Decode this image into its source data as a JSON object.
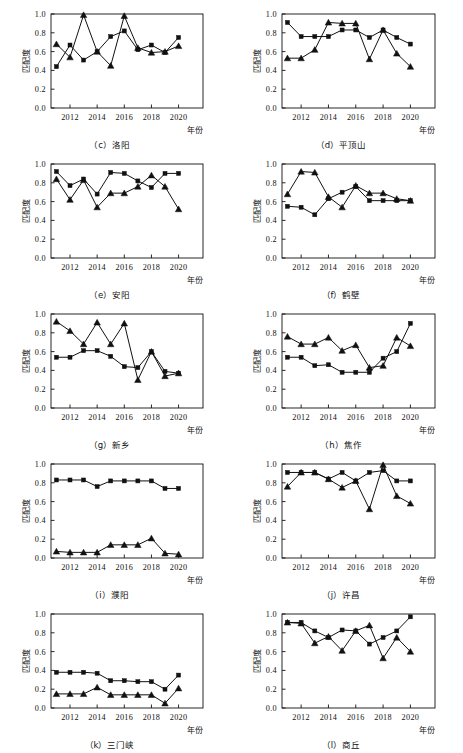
{
  "figure": {
    "axis_label_y": "匹配度",
    "axis_label_x": "年份",
    "y_ticks": [
      "0.0",
      "0.2",
      "0.4",
      "0.6",
      "0.8",
      "1.0"
    ],
    "x_ticks": [
      "2012",
      "2014",
      "2016",
      "2018",
      "2020"
    ],
    "marker_square": "square-marker",
    "marker_triangle": "triangle-marker",
    "line_color": "#111111"
  },
  "chart_data": [
    {
      "type": "line",
      "panel_id": "c",
      "title": "（c）洛阳",
      "caption_label": "（c）洛阳",
      "xlabel": "年份",
      "ylabel": "匹配度",
      "ylim": [
        0.0,
        1.0
      ],
      "xlim": [
        2010.6,
        2021.8
      ],
      "grid": false,
      "legend": "none",
      "x": [
        2011,
        2012,
        2013,
        2014,
        2015,
        2016,
        2017,
        2018,
        2019,
        2020
      ],
      "series": [
        {
          "name": "square",
          "marker": "square",
          "values": [
            0.44,
            0.67,
            0.51,
            0.6,
            0.76,
            0.82,
            0.62,
            0.67,
            0.59,
            0.75
          ]
        },
        {
          "name": "triangle",
          "marker": "triangle",
          "values": [
            0.68,
            0.54,
            0.99,
            0.6,
            0.45,
            0.98,
            0.64,
            0.59,
            0.6,
            0.66
          ]
        }
      ]
    },
    {
      "type": "line",
      "panel_id": "d",
      "title": "（d）平顶山",
      "caption_label": "（d）平顶山",
      "xlabel": "年份",
      "ylabel": "匹配度",
      "ylim": [
        0.0,
        1.0
      ],
      "xlim": [
        2010.6,
        2021.8
      ],
      "grid": false,
      "legend": "none",
      "x": [
        2011,
        2012,
        2013,
        2014,
        2015,
        2016,
        2017,
        2018,
        2019,
        2020
      ],
      "series": [
        {
          "name": "square",
          "marker": "square",
          "values": [
            0.91,
            0.76,
            0.76,
            0.76,
            0.83,
            0.83,
            0.75,
            0.83,
            0.75,
            0.68
          ]
        },
        {
          "name": "triangle",
          "marker": "triangle",
          "values": [
            0.53,
            0.53,
            0.62,
            0.91,
            0.9,
            0.9,
            0.52,
            0.83,
            0.58,
            0.44
          ]
        }
      ]
    },
    {
      "type": "line",
      "panel_id": "e",
      "title": "（e）安阳",
      "caption_label": "（e）安阳",
      "xlabel": "年份",
      "ylabel": "匹配度",
      "ylim": [
        0.0,
        1.0
      ],
      "xlim": [
        2010.6,
        2021.8
      ],
      "grid": false,
      "legend": "none",
      "x": [
        2011,
        2012,
        2013,
        2014,
        2015,
        2016,
        2017,
        2018,
        2019,
        2020
      ],
      "series": [
        {
          "name": "square",
          "marker": "square",
          "values": [
            0.92,
            0.77,
            0.84,
            0.68,
            0.91,
            0.9,
            0.82,
            0.75,
            0.9,
            0.9
          ]
        },
        {
          "name": "triangle",
          "marker": "triangle",
          "values": [
            0.84,
            0.62,
            0.83,
            0.54,
            0.69,
            0.69,
            0.76,
            0.88,
            0.76,
            0.52
          ]
        }
      ]
    },
    {
      "type": "line",
      "panel_id": "f",
      "title": "（f）鹤壁",
      "caption_label": "（f）鹤壁",
      "xlabel": "年份",
      "ylabel": "匹配度",
      "ylim": [
        0.0,
        1.0
      ],
      "xlim": [
        2010.6,
        2021.8
      ],
      "grid": false,
      "legend": "none",
      "x": [
        2011,
        2012,
        2013,
        2014,
        2015,
        2016,
        2017,
        2018,
        2019,
        2020
      ],
      "series": [
        {
          "name": "square",
          "marker": "square",
          "values": [
            0.55,
            0.54,
            0.46,
            0.63,
            0.7,
            0.76,
            0.61,
            0.61,
            0.61,
            0.61
          ]
        },
        {
          "name": "triangle",
          "marker": "triangle",
          "values": [
            0.68,
            0.92,
            0.91,
            0.65,
            0.54,
            0.77,
            0.69,
            0.69,
            0.63,
            0.61
          ]
        }
      ]
    },
    {
      "type": "line",
      "panel_id": "g",
      "title": "（g）新乡",
      "caption_label": "（g）新乡",
      "xlabel": "年份",
      "ylabel": "匹配度",
      "ylim": [
        0.0,
        1.0
      ],
      "xlim": [
        2010.6,
        2021.8
      ],
      "grid": false,
      "legend": "none",
      "x": [
        2011,
        2012,
        2013,
        2014,
        2015,
        2016,
        2017,
        2018,
        2019,
        2020
      ],
      "series": [
        {
          "name": "square",
          "marker": "square",
          "values": [
            0.54,
            0.54,
            0.61,
            0.61,
            0.55,
            0.44,
            0.43,
            0.6,
            0.39,
            0.37
          ]
        },
        {
          "name": "triangle",
          "marker": "triangle",
          "values": [
            0.92,
            0.82,
            0.68,
            0.91,
            0.68,
            0.9,
            0.3,
            0.6,
            0.34,
            0.37
          ]
        }
      ]
    },
    {
      "type": "line",
      "panel_id": "h",
      "title": "（h）焦作",
      "caption_label": "（h）焦作",
      "xlabel": "年份",
      "ylabel": "匹配度",
      "ylim": [
        0.0,
        1.0
      ],
      "xlim": [
        2010.6,
        2021.8
      ],
      "grid": false,
      "legend": "none",
      "x": [
        2011,
        2012,
        2013,
        2014,
        2015,
        2016,
        2017,
        2018,
        2019,
        2020
      ],
      "series": [
        {
          "name": "square",
          "marker": "square",
          "values": [
            0.54,
            0.54,
            0.45,
            0.46,
            0.38,
            0.38,
            0.38,
            0.53,
            0.6,
            0.9
          ]
        },
        {
          "name": "triangle",
          "marker": "triangle",
          "values": [
            0.76,
            0.68,
            0.68,
            0.75,
            0.61,
            0.67,
            0.43,
            0.45,
            0.75,
            0.66
          ]
        }
      ]
    },
    {
      "type": "line",
      "panel_id": "i",
      "title": "（i）濮阳",
      "caption_label": "（i）濮阳",
      "xlabel": "年份",
      "ylabel": "匹配度",
      "ylim": [
        0.0,
        1.0
      ],
      "xlim": [
        2010.6,
        2021.8
      ],
      "grid": false,
      "legend": "none",
      "x": [
        2011,
        2012,
        2013,
        2014,
        2015,
        2016,
        2017,
        2018,
        2019,
        2020
      ],
      "series": [
        {
          "name": "square",
          "marker": "square",
          "values": [
            0.83,
            0.83,
            0.83,
            0.76,
            0.82,
            0.82,
            0.82,
            0.82,
            0.74,
            0.74
          ]
        },
        {
          "name": "triangle",
          "marker": "triangle",
          "values": [
            0.07,
            0.06,
            0.06,
            0.06,
            0.14,
            0.14,
            0.14,
            0.21,
            0.05,
            0.04
          ]
        }
      ]
    },
    {
      "type": "line",
      "panel_id": "j",
      "title": "（j）许昌",
      "caption_label": "（j）许昌",
      "xlabel": "年份",
      "ylabel": "匹配度",
      "ylim": [
        0.0,
        1.0
      ],
      "xlim": [
        2010.6,
        2021.8
      ],
      "grid": false,
      "legend": "none",
      "x": [
        2011,
        2012,
        2013,
        2014,
        2015,
        2016,
        2017,
        2018,
        2019,
        2020
      ],
      "series": [
        {
          "name": "square",
          "marker": "square",
          "values": [
            0.91,
            0.91,
            0.91,
            0.84,
            0.91,
            0.82,
            0.91,
            0.93,
            0.82,
            0.82
          ]
        },
        {
          "name": "triangle",
          "marker": "triangle",
          "values": [
            0.76,
            0.91,
            0.91,
            0.84,
            0.75,
            0.82,
            0.52,
            0.99,
            0.66,
            0.58
          ]
        }
      ]
    },
    {
      "type": "line",
      "panel_id": "k",
      "title": "（k）三门峡",
      "caption_label": "（k）三门峡",
      "xlabel": "年份",
      "ylabel": "匹配度",
      "ylim": [
        0.0,
        1.0
      ],
      "xlim": [
        2010.6,
        2021.8
      ],
      "grid": false,
      "legend": "none",
      "x": [
        2011,
        2012,
        2013,
        2014,
        2015,
        2016,
        2017,
        2018,
        2019,
        2020
      ],
      "series": [
        {
          "name": "square",
          "marker": "square",
          "values": [
            0.38,
            0.38,
            0.38,
            0.37,
            0.29,
            0.29,
            0.28,
            0.28,
            0.2,
            0.35
          ]
        },
        {
          "name": "triangle",
          "marker": "triangle",
          "values": [
            0.15,
            0.15,
            0.15,
            0.22,
            0.14,
            0.14,
            0.14,
            0.14,
            0.05,
            0.21
          ]
        }
      ]
    },
    {
      "type": "line",
      "panel_id": "l",
      "title": "（l）商丘",
      "caption_label": "（l）商丘",
      "xlabel": "年份",
      "ylabel": "匹配度",
      "ylim": [
        0.0,
        1.0
      ],
      "xlim": [
        2010.6,
        2021.8
      ],
      "grid": false,
      "legend": "none",
      "x": [
        2011,
        2012,
        2013,
        2014,
        2015,
        2016,
        2017,
        2018,
        2019,
        2020
      ],
      "series": [
        {
          "name": "square",
          "marker": "square",
          "values": [
            0.91,
            0.91,
            0.82,
            0.75,
            0.83,
            0.82,
            0.68,
            0.75,
            0.82,
            0.97
          ]
        },
        {
          "name": "triangle",
          "marker": "triangle",
          "values": [
            0.91,
            0.9,
            0.69,
            0.76,
            0.61,
            0.82,
            0.88,
            0.53,
            0.75,
            0.6
          ]
        }
      ]
    }
  ]
}
